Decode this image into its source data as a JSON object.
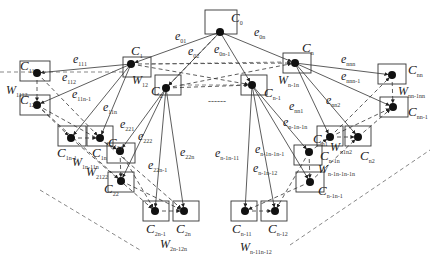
{
  "diagram": {
    "nodes": [
      {
        "id": "C0",
        "main": "C",
        "sub": "0",
        "x": 205,
        "y": 10,
        "w": 32,
        "h": 24,
        "dot": [
          220,
          32
        ],
        "lx": 231,
        "ly": 22
      },
      {
        "id": "C1",
        "main": "C",
        "sub": "1",
        "x": 123,
        "y": 57,
        "w": 28,
        "h": 20,
        "dot": [
          131,
          64
        ],
        "lx": 131,
        "ly": 55
      },
      {
        "id": "C2",
        "main": "C",
        "sub": "2",
        "x": 155,
        "y": 75,
        "w": 26,
        "h": 20,
        "dot": [
          166,
          88
        ],
        "lx": 151,
        "ly": 95
      },
      {
        "id": "Cn",
        "main": "C",
        "sub": "n",
        "x": 283,
        "y": 53,
        "w": 28,
        "h": 20,
        "dot": [
          295,
          63
        ],
        "lx": 302,
        "ly": 52
      },
      {
        "id": "Cn-1",
        "main": "C",
        "sub": "n-1",
        "x": 241,
        "y": 75,
        "w": 26,
        "h": 20,
        "dot": [
          252,
          85
        ],
        "lx": 264,
        "ly": 97
      },
      {
        "id": "C11",
        "main": "C",
        "sub": "11",
        "x": 20,
        "y": 61,
        "w": 30,
        "h": 20,
        "dot": [
          37,
          73
        ],
        "lx": 20,
        "ly": 70
      },
      {
        "id": "C12",
        "main": "C",
        "sub": "12",
        "x": 20,
        "y": 95,
        "w": 30,
        "h": 20,
        "dot": [
          37,
          105
        ],
        "lx": 20,
        "ly": 104
      },
      {
        "id": "C1n-1",
        "main": "C",
        "sub": "1n-1",
        "x": 58,
        "y": 126,
        "w": 28,
        "h": 20,
        "dot": [
          71,
          138
        ],
        "lx": 57,
        "ly": 157
      },
      {
        "id": "C1n",
        "main": "C",
        "sub": "1n",
        "x": 87,
        "y": 126,
        "w": 26,
        "h": 20,
        "dot": [
          100,
          138
        ],
        "lx": 92,
        "ly": 157
      },
      {
        "id": "C21",
        "main": "C",
        "sub": "21",
        "x": 107,
        "y": 143,
        "w": 28,
        "h": 20,
        "dot": [
          120,
          151
        ],
        "lx": 108,
        "ly": 147
      },
      {
        "id": "C22",
        "main": "C",
        "sub": "22",
        "x": 108,
        "y": 172,
        "w": 26,
        "h": 20,
        "dot": [
          121,
          181
        ],
        "lx": 104,
        "ly": 193
      },
      {
        "id": "C2n-1",
        "main": "C",
        "sub": "2n-1",
        "x": 143,
        "y": 201,
        "w": 26,
        "h": 20,
        "dot": [
          155,
          211
        ],
        "lx": 146,
        "ly": 233
      },
      {
        "id": "C2n",
        "main": "C",
        "sub": "2n",
        "x": 173,
        "y": 201,
        "w": 26,
        "h": 20,
        "dot": [
          184,
          211
        ],
        "lx": 176,
        "ly": 233
      },
      {
        "id": "Cn1",
        "main": "C",
        "sub": "n1",
        "x": 317,
        "y": 126,
        "w": 26,
        "h": 20,
        "dot": [
          330,
          137
        ],
        "lx": 313,
        "ly": 143
      },
      {
        "id": "Cn2",
        "main": "C",
        "sub": "n2",
        "x": 345,
        "y": 126,
        "w": 26,
        "h": 20,
        "dot": [
          358,
          137
        ],
        "lx": 360,
        "ly": 160
      },
      {
        "id": "Cn-1n",
        "main": "C",
        "sub": "n-1n",
        "x": 294,
        "y": 145,
        "w": 28,
        "h": 20,
        "dot": [
          309,
          152
        ],
        "lx": 320,
        "ly": 160
      },
      {
        "id": "Cn-1n-1",
        "main": "C",
        "sub": "n-1n-1",
        "x": 296,
        "y": 172,
        "w": 28,
        "h": 20,
        "dot": [
          310,
          182
        ],
        "lx": 318,
        "ly": 195
      },
      {
        "id": "Cnn",
        "main": "C",
        "sub": "nn",
        "x": 378,
        "y": 64,
        "w": 28,
        "h": 20,
        "dot": [
          392,
          75
        ],
        "lx": 408,
        "ly": 74
      },
      {
        "id": "Cnn-1",
        "main": "C",
        "sub": "nn-1",
        "x": 380,
        "y": 97,
        "w": 28,
        "h": 20,
        "dot": [
          393,
          107
        ],
        "lx": 408,
        "ly": 116
      },
      {
        "id": "Cn-11",
        "main": "C",
        "sub": "n-11",
        "x": 231,
        "y": 201,
        "w": 26,
        "h": 20,
        "dot": [
          245,
          211
        ],
        "lx": 232,
        "ly": 233
      },
      {
        "id": "Cn-12",
        "main": "C",
        "sub": "n-12",
        "x": 261,
        "y": 201,
        "w": 26,
        "h": 20,
        "dot": [
          275,
          211
        ],
        "lx": 268,
        "ly": 233
      }
    ],
    "edge_labels": [
      {
        "main": "e",
        "sub": "01",
        "x": 175,
        "y": 40
      },
      {
        "main": "e",
        "sub": "02",
        "x": 188,
        "y": 55
      },
      {
        "main": "e",
        "sub": "0n-1",
        "x": 214,
        "y": 53
      },
      {
        "main": "e",
        "sub": "0n",
        "x": 254,
        "y": 36
      },
      {
        "main": "e",
        "sub": "111",
        "x": 73,
        "y": 63
      },
      {
        "main": "e",
        "sub": "112",
        "x": 62,
        "y": 81
      },
      {
        "main": "e",
        "sub": "11n-1",
        "x": 72,
        "y": 98
      },
      {
        "main": "e",
        "sub": "11n",
        "x": 103,
        "y": 111
      },
      {
        "main": "e",
        "sub": "221",
        "x": 120,
        "y": 128
      },
      {
        "main": "e",
        "sub": "222",
        "x": 138,
        "y": 140
      },
      {
        "main": "e",
        "sub": "22n-1",
        "x": 148,
        "y": 169
      },
      {
        "main": "e",
        "sub": "22n",
        "x": 180,
        "y": 156
      },
      {
        "main": "e",
        "sub": "n-1n-11",
        "x": 215,
        "y": 157
      },
      {
        "main": "e",
        "sub": "n-1n-1n-1",
        "x": 255,
        "y": 153
      },
      {
        "main": "e",
        "sub": "n-1n-12",
        "x": 253,
        "y": 172
      },
      {
        "main": "e",
        "sub": "n-1n-1n",
        "x": 283,
        "y": 126
      },
      {
        "main": "e",
        "sub": "nn1",
        "x": 289,
        "y": 110
      },
      {
        "main": "e",
        "sub": "nn2",
        "x": 326,
        "y": 104
      },
      {
        "main": "e",
        "sub": "nnn",
        "x": 341,
        "y": 63
      },
      {
        "main": "e",
        "sub": "nnn-1",
        "x": 341,
        "y": 80
      }
    ],
    "weight_labels": [
      {
        "main": "W",
        "sub": "1112",
        "x": 6,
        "y": 94
      },
      {
        "main": "W",
        "sub": "12",
        "x": 132,
        "y": 84
      },
      {
        "main": "W",
        "sub": "1n-11n",
        "x": 72,
        "y": 166
      },
      {
        "main": "W",
        "sub": "2122",
        "x": 86,
        "y": 176
      },
      {
        "main": "W",
        "sub": "2n-12n",
        "x": 160,
        "y": 248
      },
      {
        "main": "W",
        "sub": "n-1n",
        "x": 278,
        "y": 84
      },
      {
        "main": "W",
        "sub": "n1n2",
        "x": 330,
        "y": 151
      },
      {
        "main": "W",
        "sub": "nn-1nn",
        "x": 398,
        "y": 95
      },
      {
        "main": "W",
        "sub": "n-1n-1n-1n",
        "x": 318,
        "y": 173
      },
      {
        "main": "W",
        "sub": "n-11n-12",
        "x": 240,
        "y": 251
      }
    ],
    "ellipsis": "------"
  }
}
